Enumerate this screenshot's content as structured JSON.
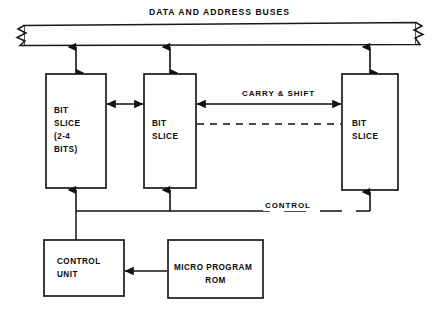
{
  "diagram": {
    "bus": {
      "label": "DATA AND ADDRESS BUSES",
      "break_ends": "both"
    },
    "blocks": [
      {
        "id": "bit-slice-1",
        "name": "bit-slice-block-left",
        "lines": [
          "BIT",
          "SLICE",
          "(2-4",
          "BITS)"
        ],
        "x": 46,
        "y": 74,
        "w": 60,
        "h": 114
      },
      {
        "id": "bit-slice-2",
        "name": "bit-slice-block-middle",
        "lines": [
          "BIT",
          "SLICE"
        ],
        "x": 144,
        "y": 74,
        "w": 52,
        "h": 114
      },
      {
        "id": "bit-slice-3",
        "name": "bit-slice-block-right",
        "lines": [
          "BIT",
          "SLICE"
        ],
        "x": 342,
        "y": 74,
        "w": 56,
        "h": 116
      },
      {
        "id": "control-unit",
        "name": "control-unit-block",
        "lines": [
          "CONTROL",
          "UNIT"
        ],
        "x": 44,
        "y": 240,
        "w": 80,
        "h": 56
      },
      {
        "id": "micro-program-rom",
        "name": "micro-program-rom-block",
        "lines": [
          "MICRO PROGRAM",
          "ROM"
        ],
        "x": 168,
        "y": 240,
        "w": 95,
        "h": 58
      }
    ],
    "wires": [
      {
        "id": "carry-shift",
        "label": "CARRY & SHIFT",
        "style": "solid-double-arrow"
      },
      {
        "id": "carry-shift-dashed",
        "label": "",
        "style": "dashed"
      },
      {
        "id": "control",
        "label": "CONTROL",
        "style": "solid-with-dash-gap"
      }
    ],
    "labels": {
      "bus_title": "DATA AND ADDRESS BUSES",
      "carry_shift": "CARRY & SHIFT",
      "control": "CONTROL"
    },
    "colors": {
      "line": "#1a1a1a",
      "text": "#0a0a0a",
      "background": "#ffffff"
    }
  }
}
